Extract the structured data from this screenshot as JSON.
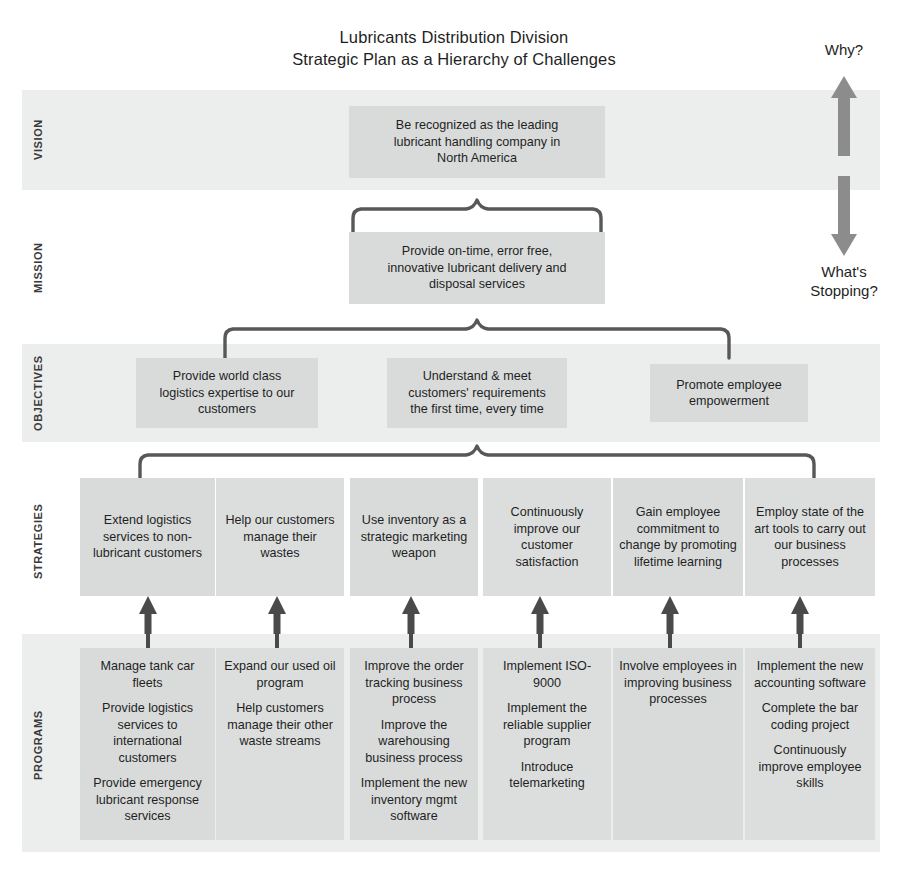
{
  "title": {
    "line1": "Lubricants Distribution Division",
    "line2": "Strategic Plan as a Hierarchy of Challenges"
  },
  "side_labels": {
    "top": "Why?",
    "bottom_line1": "What's",
    "bottom_line2": "Stopping?",
    "arrow_icon": "double-headed-vertical-arrow-icon"
  },
  "colors": {
    "band": "#eceeee",
    "node": "#d9dbdb",
    "connector": "#585858",
    "arrow": "#4a4a4a",
    "text": "#1f1f1f"
  },
  "rows": [
    {
      "key": "vision",
      "label": "VISION"
    },
    {
      "key": "mission",
      "label": "MISSION"
    },
    {
      "key": "objectives",
      "label": "OBJECTIVES"
    },
    {
      "key": "strategies",
      "label": "STRATEGIES"
    },
    {
      "key": "programs",
      "label": "PROGRAMS"
    }
  ],
  "vision": {
    "line1": "Be recognized as the leading",
    "line2": "lubricant handling company in",
    "line3": "North America"
  },
  "mission": {
    "line1": "Provide on-time, error free,",
    "line2": "innovative lubricant delivery and",
    "line3": "disposal services"
  },
  "objectives": [
    {
      "line1": "Provide world class",
      "line2": "logistics expertise to our",
      "line3": "customers"
    },
    {
      "line1": "Understand & meet",
      "line2": "customers' requirements",
      "line3": "the first time, every time"
    },
    {
      "line1": "Promote employee",
      "line2": "empowerment",
      "line3": ""
    }
  ],
  "strategies": [
    {
      "text": "Extend logistics services to non-lubricant customers"
    },
    {
      "text": "Help our customers manage their wastes"
    },
    {
      "text": "Use inventory as a strategic marketing weapon"
    },
    {
      "text": "Continuously improve our customer satisfaction"
    },
    {
      "text": "Gain employee commitment to change by promoting lifetime learning"
    },
    {
      "text": "Employ state of the art tools to carry out our business processes"
    }
  ],
  "programs": [
    {
      "items": [
        "Manage tank car fleets",
        "Provide logistics services to international customers",
        "Provide emergency lubricant response services"
      ]
    },
    {
      "items": [
        "Expand our used oil program",
        "Help customers manage their other waste streams"
      ]
    },
    {
      "items": [
        "Improve the order tracking business process",
        "Improve the warehousing business process",
        "Implement the new inventory mgmt software"
      ]
    },
    {
      "items": [
        "Implement ISO-9000",
        "Implement the reliable supplier program",
        "Introduce telemarketing"
      ]
    },
    {
      "items": [
        "Involve employees in improving business processes"
      ]
    },
    {
      "items": [
        "Implement the new accounting software",
        "Complete the bar coding project",
        "Continuously improve employee skills"
      ]
    }
  ]
}
